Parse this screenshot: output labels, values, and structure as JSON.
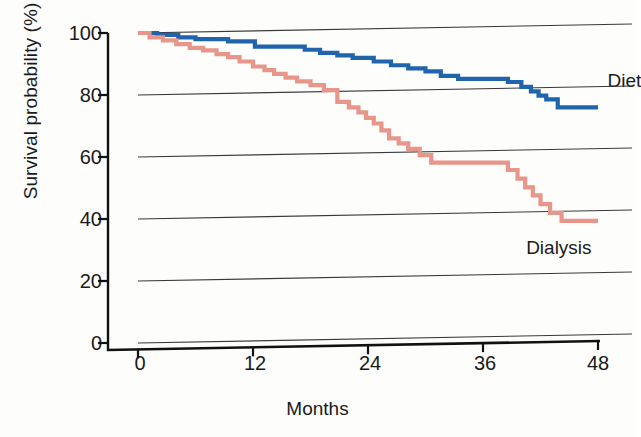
{
  "chart_data": {
    "type": "line",
    "subtype": "kaplan-meier-step",
    "title": "",
    "xlabel": "Months",
    "ylabel": "Survival probability (%)",
    "xlim": [
      0,
      48
    ],
    "ylim": [
      0,
      100
    ],
    "xticks": [
      0,
      12,
      24,
      36,
      48
    ],
    "yticks": [
      0,
      20,
      40,
      60,
      80,
      100
    ],
    "grid": "horizontal",
    "legend_position": "inline-right-of-curve",
    "series": [
      {
        "name": "Diet",
        "color": "#2064ad",
        "label_x": 49.0,
        "label_y": 84,
        "steps": [
          [
            0,
            100
          ],
          [
            2.0,
            100
          ],
          [
            2.0,
            99.4
          ],
          [
            4.2,
            99.4
          ],
          [
            4.2,
            98.6
          ],
          [
            6.0,
            98.6
          ],
          [
            6.0,
            98.0
          ],
          [
            9.4,
            98.0
          ],
          [
            9.4,
            97.3
          ],
          [
            12.2,
            97.3
          ],
          [
            12.2,
            95.6
          ],
          [
            17.4,
            95.6
          ],
          [
            17.4,
            94.6
          ],
          [
            19.0,
            94.6
          ],
          [
            19.0,
            93.6
          ],
          [
            20.8,
            93.6
          ],
          [
            20.8,
            92.8
          ],
          [
            22.4,
            92.8
          ],
          [
            22.4,
            92.0
          ],
          [
            24.6,
            92.0
          ],
          [
            24.6,
            90.8
          ],
          [
            26.4,
            90.8
          ],
          [
            26.4,
            89.6
          ],
          [
            28.2,
            89.6
          ],
          [
            28.2,
            88.6
          ],
          [
            30.0,
            88.6
          ],
          [
            30.0,
            87.6
          ],
          [
            31.6,
            87.6
          ],
          [
            31.6,
            86.2
          ],
          [
            33.4,
            86.2
          ],
          [
            33.4,
            85.2
          ],
          [
            38.6,
            85.2
          ],
          [
            38.6,
            84.2
          ],
          [
            40.0,
            84.2
          ],
          [
            40.0,
            82.6
          ],
          [
            41.0,
            82.6
          ],
          [
            41.0,
            81.2
          ],
          [
            41.8,
            81.2
          ],
          [
            41.8,
            79.8
          ],
          [
            42.6,
            79.8
          ],
          [
            42.6,
            78.6
          ],
          [
            43.8,
            78.6
          ],
          [
            43.8,
            76.0
          ],
          [
            48,
            76.0
          ]
        ]
      },
      {
        "name": "Dialysis",
        "color": "#e8958a",
        "label_x": 40.5,
        "label_y": 30,
        "steps": [
          [
            0,
            100
          ],
          [
            1.2,
            100
          ],
          [
            1.2,
            98.6
          ],
          [
            2.6,
            98.6
          ],
          [
            2.6,
            97.6
          ],
          [
            4.0,
            97.6
          ],
          [
            4.0,
            96.4
          ],
          [
            5.4,
            96.4
          ],
          [
            5.4,
            95.2
          ],
          [
            6.8,
            95.2
          ],
          [
            6.8,
            94.4
          ],
          [
            8.2,
            94.4
          ],
          [
            8.2,
            93.2
          ],
          [
            9.4,
            93.2
          ],
          [
            9.4,
            92.2
          ],
          [
            10.6,
            92.2
          ],
          [
            10.6,
            90.8
          ],
          [
            12.0,
            90.8
          ],
          [
            12.0,
            89.2
          ],
          [
            13.2,
            89.2
          ],
          [
            13.2,
            88.0
          ],
          [
            14.2,
            88.0
          ],
          [
            14.2,
            86.8
          ],
          [
            15.4,
            86.8
          ],
          [
            15.4,
            85.6
          ],
          [
            16.6,
            85.6
          ],
          [
            16.6,
            84.4
          ],
          [
            18.0,
            84.4
          ],
          [
            18.0,
            83.2
          ],
          [
            19.4,
            83.2
          ],
          [
            19.4,
            81.6
          ],
          [
            20.8,
            81.6
          ],
          [
            20.8,
            77.8
          ],
          [
            22.0,
            77.8
          ],
          [
            22.0,
            76.0
          ],
          [
            23.0,
            76.0
          ],
          [
            23.0,
            74.4
          ],
          [
            23.8,
            74.4
          ],
          [
            23.8,
            72.6
          ],
          [
            24.6,
            72.6
          ],
          [
            24.6,
            70.8
          ],
          [
            25.4,
            70.8
          ],
          [
            25.4,
            68.6
          ],
          [
            26.2,
            68.6
          ],
          [
            26.2,
            66.0
          ],
          [
            27.2,
            66.0
          ],
          [
            27.2,
            64.4
          ],
          [
            28.2,
            64.4
          ],
          [
            28.2,
            62.6
          ],
          [
            29.4,
            62.6
          ],
          [
            29.4,
            60.6
          ],
          [
            30.6,
            60.6
          ],
          [
            30.6,
            58.2
          ],
          [
            38.6,
            58.2
          ],
          [
            38.6,
            55.8
          ],
          [
            39.6,
            55.8
          ],
          [
            39.6,
            53.0
          ],
          [
            40.4,
            53.0
          ],
          [
            40.4,
            50.2
          ],
          [
            41.2,
            50.2
          ],
          [
            41.2,
            47.6
          ],
          [
            42.0,
            47.6
          ],
          [
            42.0,
            44.8
          ],
          [
            43.0,
            44.8
          ],
          [
            43.0,
            42.0
          ],
          [
            44.2,
            42.0
          ],
          [
            44.2,
            39.4
          ],
          [
            48,
            39.4
          ]
        ]
      }
    ]
  },
  "axes": {
    "y_label": "Survival probability (%)",
    "x_label": "Months",
    "y_ticks": [
      "100",
      "80",
      "60",
      "40",
      "20",
      "0"
    ],
    "x_ticks": [
      "0",
      "12",
      "24",
      "36",
      "48"
    ]
  },
  "legend": {
    "diet": "Diet",
    "dialysis": "Dialysis"
  },
  "colors": {
    "diet": "#2064ad",
    "dialysis": "#e8958a",
    "grid": "#3a3a3a",
    "axis": "#111111",
    "background": "#fdfdfc"
  }
}
